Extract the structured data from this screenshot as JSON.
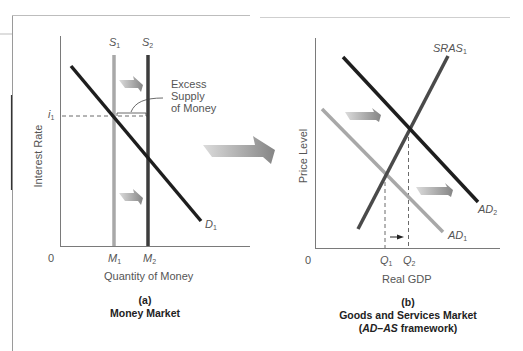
{
  "panel_a": {
    "y_axis_label": "Interest Rate",
    "x_axis_label": "Quantity of Money",
    "origin_label": "0",
    "rate_label": "i",
    "rate_sub": "1",
    "supply1_label": "S",
    "supply1_sub": "1",
    "supply2_label": "S",
    "supply2_sub": "2",
    "demand_label": "D",
    "demand_sub": "1",
    "m1_label": "M",
    "m1_sub": "1",
    "m2_label": "M",
    "m2_sub": "2",
    "annotation_line1": "Excess",
    "annotation_line2": "Supply",
    "annotation_line3": "of Money",
    "caption_letter": "(a)",
    "caption_title": "Money Market"
  },
  "panel_b": {
    "y_axis_label": "Price Level",
    "x_axis_label": "Real GDP",
    "origin_label": "0",
    "sras_label": "SRAS",
    "sras_sub": "1",
    "ad1_label": "AD",
    "ad1_sub": "1",
    "ad2_label": "AD",
    "ad2_sub": "2",
    "q1_label": "Q",
    "q1_sub": "1",
    "q2_label": "Q",
    "q2_sub": "2",
    "caption_letter": "(b)",
    "caption_title": "Goods and Services Market",
    "caption_sub_italic": "AD–AS",
    "caption_sub_rest": " framework)",
    "caption_sub_open": "("
  },
  "colors": {
    "dark_line": "#1e1e1e",
    "mid_line": "#4a4a4a",
    "light_line": "#a8a8a8",
    "axis": "#7a7a7a",
    "arrow_gradient_start": "#d8d8d8",
    "arrow_gradient_end": "#8a8a8a"
  }
}
